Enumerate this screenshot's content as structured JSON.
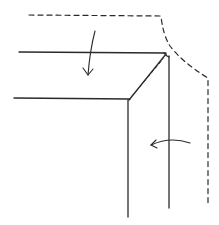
{
  "diagram": {
    "colors": {
      "background": "#ffffff",
      "ink": "#2a2a2a"
    },
    "elements": {
      "unfolded_outline": {
        "style": "dashed"
      },
      "top_fold_edge": {
        "style": "solid"
      },
      "inner_horizontal_edge": {
        "style": "solid"
      },
      "miter_diagonal": {
        "style": "solid with dashed parallel"
      },
      "inner_vertical_edge": {
        "style": "solid"
      },
      "outer_vertical_edge": {
        "style": "solid"
      },
      "fold_down_arrow": {
        "direction": "down"
      },
      "fold_left_arrow": {
        "direction": "left"
      }
    },
    "labels": []
  }
}
